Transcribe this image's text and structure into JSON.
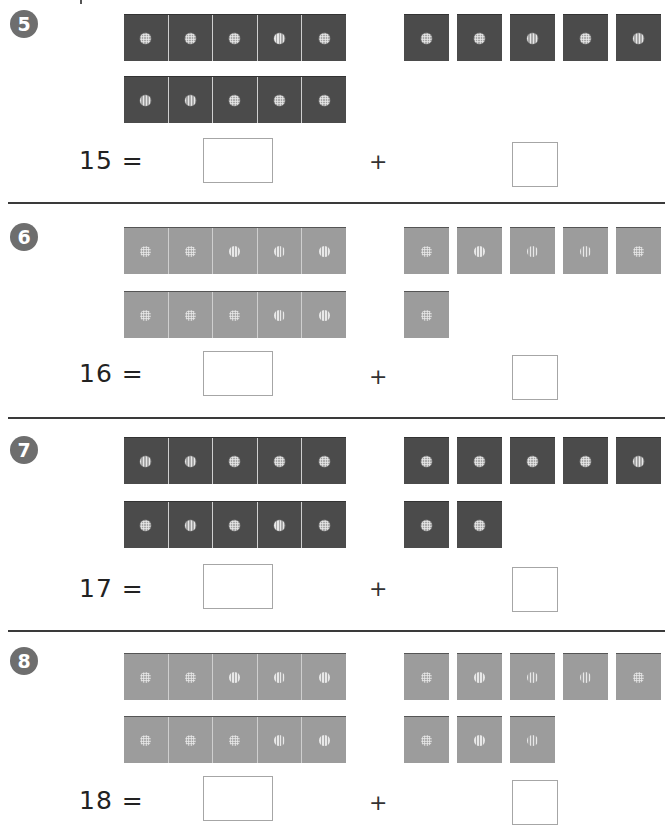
{
  "worksheet": {
    "colors": {
      "dark_tile": "#4b4b4b",
      "light_tile": "#9c9c9c",
      "badge": "#6e6e6e",
      "divider": "#3a3a3a"
    },
    "problems": [
      {
        "number": "5",
        "equation_label": "15 =",
        "operator": "+",
        "shade": "dark",
        "ten_frame_rows": 2,
        "ten_frame_cells_per_row": 5,
        "ones_row1_count": 5,
        "ones_row2_count": 0,
        "left_answer": "",
        "right_answer": ""
      },
      {
        "number": "6",
        "equation_label": "16 =",
        "operator": "+",
        "shade": "light",
        "ten_frame_rows": 2,
        "ten_frame_cells_per_row": 5,
        "ones_row1_count": 5,
        "ones_row2_count": 1,
        "left_answer": "",
        "right_answer": ""
      },
      {
        "number": "7",
        "equation_label": "17 =",
        "operator": "+",
        "shade": "dark",
        "ten_frame_rows": 2,
        "ten_frame_cells_per_row": 5,
        "ones_row1_count": 5,
        "ones_row2_count": 2,
        "left_answer": "",
        "right_answer": ""
      },
      {
        "number": "8",
        "equation_label": "18 =",
        "operator": "+",
        "shade": "light",
        "ten_frame_rows": 2,
        "ten_frame_cells_per_row": 5,
        "ones_row1_count": 5,
        "ones_row2_count": 3,
        "left_answer": "",
        "right_answer": ""
      }
    ]
  }
}
